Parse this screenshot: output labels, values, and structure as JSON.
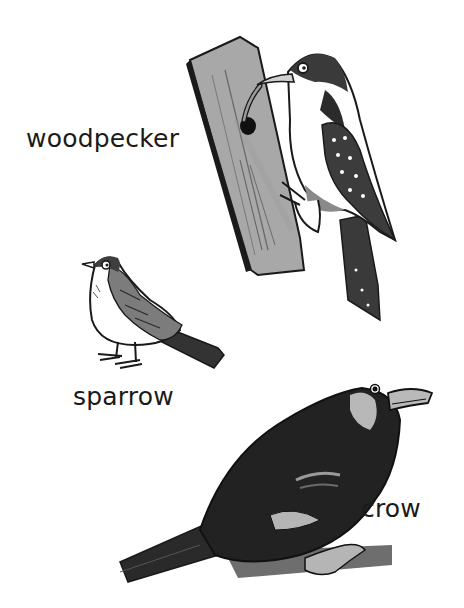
{
  "page": {
    "type": "illustrated-vocabulary",
    "background": "#ffffff",
    "ink_color": "#1a1a1a"
  },
  "birds": [
    {
      "id": "woodpecker",
      "label": "woodpecker",
      "scene": "clinging to a tree trunk with a worm in its beak"
    },
    {
      "id": "sparrow",
      "label": "sparrow",
      "scene": "standing"
    },
    {
      "id": "crow",
      "label": "crow",
      "scene": "perched on a branch"
    }
  ],
  "colors": {
    "trunk": "#a9a9a9",
    "trunk_dark": "#8c8c8c",
    "crow_body": "#222222",
    "crow_beak": "#b9b9b9",
    "branch": "#6e6e6e",
    "sparrow_back": "#7d7d7d"
  }
}
